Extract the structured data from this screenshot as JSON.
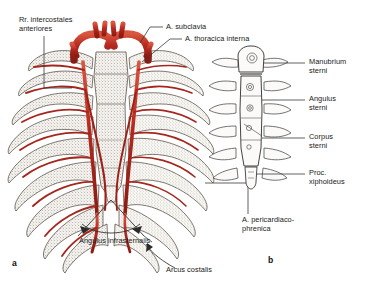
{
  "figure": {
    "background_color": "#ffffff",
    "artery_color": "#b5281e",
    "artery_dark": "#7d1a12",
    "bone_color": "#f2f0ec",
    "bone_outline": "#4a4238",
    "leader_color": "#3a3a3a",
    "text_color": "#1a1a1a"
  },
  "panels": [
    {
      "id": "a",
      "label": "a",
      "caption": "Anterior thoracic wall with internal thoracic arteries"
    },
    {
      "id": "b",
      "label": "b",
      "caption": "Sternum, anterior view"
    }
  ],
  "labels": {
    "rr_intercostales": "Rr. intercostales\nanteriores",
    "a_subclavia": "A. subclavia",
    "a_thoracica_interna": "A. thoracica interna",
    "manubrium_sterni": "Manubrium\nsterni",
    "angulus_sterni": "Angulus\nsterni",
    "corpus_sterni": "Corpus\nsterni",
    "proc_xiphoideus": "Proc.\nxiphoideus",
    "a_pericardiacophrenica": "A. pericardiaco-\nphrenica",
    "angulus_infrasternalis": "Angulus infrasternalis",
    "arcus_costalis": "Arcus costalis"
  },
  "structures": {
    "ribs_left_count": 9,
    "ribs_right_count": 9,
    "sternum_parts": [
      "Manubrium sterni",
      "Angulus sterni",
      "Corpus sterni",
      "Proc. xiphoideus"
    ],
    "arteries": [
      "A. subclavia",
      "A. thoracica interna",
      "Rr. intercostales anteriores",
      "A. pericardiacophrenica"
    ]
  }
}
